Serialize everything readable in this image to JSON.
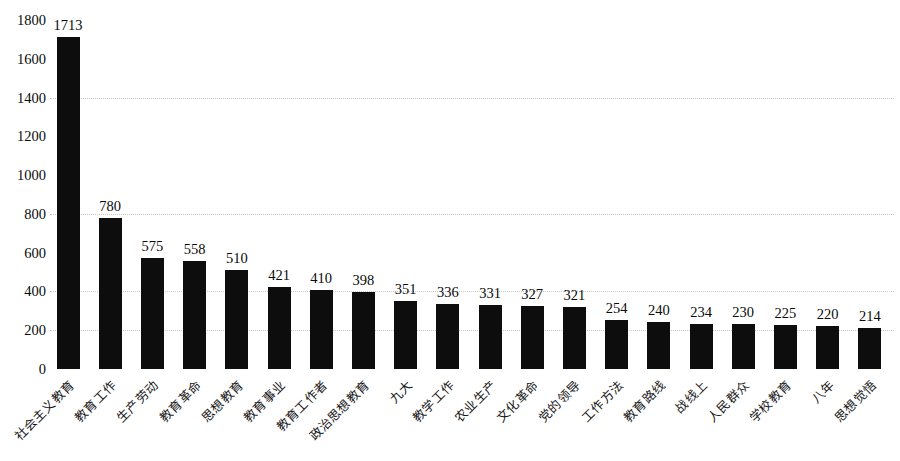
{
  "chart_data": {
    "type": "bar",
    "title": "",
    "subtitle": "",
    "xlabel": "",
    "ylabel": "",
    "ylim": [
      0,
      1800
    ],
    "y_ticks": [
      0,
      200,
      400,
      600,
      800,
      1000,
      1200,
      1400,
      1600,
      1800
    ],
    "y_tick_labels": [
      "0",
      "200",
      "400",
      "600",
      "800",
      "1000",
      "1200",
      "1400",
      "1600",
      "1800"
    ],
    "gridlines": [
      200,
      400,
      800,
      1400
    ],
    "grid": true,
    "legend": null,
    "legend_position": "none",
    "bar_color": "#0d0d0d",
    "categories": [
      "社会主义教育",
      "教育工作",
      "生产劳动",
      "教育革命",
      "思想教育",
      "教育事业",
      "教育工作者",
      "政治思想教育",
      "九大",
      "教学工作",
      "农业生产",
      "文化革命",
      "党的领导",
      "工作方法",
      "教育路线",
      "战线上",
      "人民群众",
      "学校教育",
      "八年",
      "思想觉悟"
    ],
    "values": [
      1713,
      780,
      575,
      558,
      510,
      421,
      410,
      398,
      351,
      336,
      331,
      327,
      321,
      254,
      240,
      234,
      230,
      225,
      220,
      214
    ],
    "value_labels": [
      "1713",
      "780",
      "575",
      "558",
      "510",
      "421",
      "410",
      "398",
      "351",
      "336",
      "331",
      "327",
      "321",
      "254",
      "240",
      "234",
      "230",
      "225",
      "220",
      "214"
    ]
  }
}
